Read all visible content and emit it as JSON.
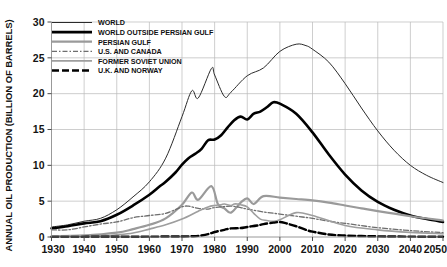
{
  "chart_data": {
    "type": "line",
    "title": "",
    "xlabel": "",
    "ylabel": "ANNUAL OIL PRODUCTION (BILLION OF BARRELS)",
    "xlim": [
      1930,
      2050
    ],
    "ylim": [
      0,
      30
    ],
    "xticks": [
      1930,
      1940,
      1950,
      1960,
      1970,
      1980,
      1990,
      2000,
      2010,
      2020,
      2030,
      2040,
      2050
    ],
    "yticks": [
      0,
      5,
      10,
      15,
      20,
      25,
      30
    ],
    "grid": true,
    "legend_position": "top-left",
    "series": [
      {
        "name": "WORLD",
        "style": "solid-thin-dark",
        "color": "#2b2b2b",
        "width": 1.0,
        "dash": "",
        "x": [
          1930,
          1935,
          1940,
          1945,
          1950,
          1955,
          1960,
          1965,
          1970,
          1973,
          1975,
          1979,
          1980,
          1983,
          1985,
          1990,
          1995,
          2000,
          2005,
          2008,
          2010,
          2015,
          2020,
          2025,
          2030,
          2035,
          2040,
          2045,
          2050
        ],
        "values": [
          1.4,
          1.7,
          2.2,
          2.6,
          3.8,
          5.6,
          7.7,
          11.0,
          16.8,
          20.4,
          19.4,
          23.5,
          22.6,
          19.6,
          20.2,
          22.5,
          23.6,
          25.9,
          26.9,
          26.7,
          26.2,
          24.4,
          21.4,
          18.0,
          14.8,
          12.1,
          10.0,
          8.6,
          7.6
        ]
      },
      {
        "name": "WORLD OUTSIDE PERSIAN GULF",
        "style": "solid-thick-black",
        "color": "#000000",
        "width": 2.6,
        "dash": "",
        "x": [
          1930,
          1935,
          1940,
          1945,
          1950,
          1955,
          1960,
          1963,
          1965,
          1968,
          1970,
          1972,
          1974,
          1976,
          1978,
          1980,
          1982,
          1984,
          1986,
          1988,
          1990,
          1992,
          1994,
          1996,
          1998,
          2000,
          2005,
          2010,
          2015,
          2020,
          2025,
          2030,
          2035,
          2040,
          2045,
          2050
        ],
        "values": [
          1.2,
          1.5,
          1.9,
          2.2,
          3.1,
          4.4,
          5.9,
          7.0,
          7.7,
          9.0,
          10.1,
          11.0,
          11.6,
          12.3,
          13.5,
          13.6,
          14.2,
          15.3,
          16.3,
          16.8,
          16.4,
          17.2,
          17.5,
          18.1,
          18.8,
          18.6,
          17.2,
          14.6,
          11.5,
          8.7,
          6.5,
          4.9,
          3.8,
          3.0,
          2.5,
          2.1
        ]
      },
      {
        "name": "PERSIAN GULF",
        "style": "solid-thick-grey",
        "color": "#9a9a9a",
        "width": 2.2,
        "dash": "",
        "x": [
          1930,
          1940,
          1950,
          1955,
          1960,
          1965,
          1970,
          1973,
          1975,
          1979,
          1981,
          1983,
          1985,
          1988,
          1990,
          1992,
          1995,
          2000,
          2005,
          2010,
          2015,
          2020,
          2025,
          2030,
          2040,
          2050
        ],
        "values": [
          0.1,
          0.2,
          0.6,
          1.1,
          1.7,
          2.6,
          4.5,
          6.2,
          5.2,
          7.1,
          4.6,
          4.0,
          3.4,
          4.8,
          5.4,
          4.6,
          5.7,
          5.5,
          5.3,
          5.1,
          4.8,
          4.4,
          4.0,
          3.6,
          2.9,
          2.3
        ]
      },
      {
        "name": "U.S. AND CANADA",
        "style": "dash-dot-grey",
        "color": "#6e6e6e",
        "width": 1.3,
        "dash": "5,2,1.5,2",
        "x": [
          1930,
          1935,
          1940,
          1945,
          1950,
          1955,
          1960,
          1965,
          1970,
          1972,
          1975,
          1978,
          1980,
          1985,
          1988,
          1990,
          1995,
          2000,
          2005,
          2010,
          2015,
          2020,
          2030,
          2040,
          2050
        ],
        "values": [
          1.0,
          1.0,
          1.4,
          1.8,
          2.1,
          2.7,
          3.0,
          3.3,
          4.2,
          4.3,
          4.0,
          3.9,
          4.1,
          4.3,
          4.1,
          3.9,
          3.5,
          3.2,
          2.9,
          2.6,
          2.2,
          1.9,
          1.3,
          0.9,
          0.6
        ]
      },
      {
        "name": "FORMER SOVIET UNION",
        "style": "solid-grey",
        "color": "#9e9e9e",
        "width": 1.6,
        "dash": "",
        "x": [
          1930,
          1940,
          1945,
          1950,
          1955,
          1960,
          1965,
          1970,
          1975,
          1978,
          1980,
          1982,
          1983,
          1985,
          1986,
          1987,
          1988,
          1990,
          1992,
          1994,
          1996,
          1998,
          2000,
          2005,
          2010,
          2020,
          2030,
          2040,
          2050
        ],
        "values": [
          0.15,
          0.25,
          0.15,
          0.3,
          0.55,
          1.1,
          1.7,
          2.5,
          3.6,
          4.2,
          4.4,
          4.5,
          4.6,
          4.4,
          4.6,
          4.6,
          4.5,
          4.2,
          3.3,
          2.5,
          2.3,
          2.2,
          2.4,
          3.4,
          3.0,
          1.6,
          1.0,
          0.65,
          0.45
        ]
      },
      {
        "name": "U.K. AND NORWAY",
        "style": "dashed-thick-black",
        "color": "#000000",
        "width": 2.4,
        "dash": "7,3",
        "x": [
          1930,
          1950,
          1960,
          1970,
          1973,
          1975,
          1978,
          1980,
          1983,
          1985,
          1988,
          1990,
          1993,
          1995,
          1998,
          2000,
          2002,
          2005,
          2008,
          2010,
          2015,
          2020,
          2025,
          2030,
          2040,
          2050
        ],
        "values": [
          0.02,
          0.03,
          0.05,
          0.08,
          0.1,
          0.15,
          0.4,
          0.7,
          1.0,
          1.2,
          1.25,
          1.4,
          1.6,
          1.8,
          2.0,
          2.1,
          1.9,
          1.5,
          1.0,
          0.75,
          0.35,
          0.2,
          0.13,
          0.09,
          0.05,
          0.03
        ]
      }
    ]
  },
  "legend": {
    "items": [
      {
        "label": "WORLD"
      },
      {
        "label": "WORLD OUTSIDE PERSIAN GULF"
      },
      {
        "label": "PERSIAN GULF"
      },
      {
        "label": "U.S. AND CANADA"
      },
      {
        "label": "FORMER SOVIET UNION"
      },
      {
        "label": "U.K. AND NORWAY"
      }
    ]
  }
}
